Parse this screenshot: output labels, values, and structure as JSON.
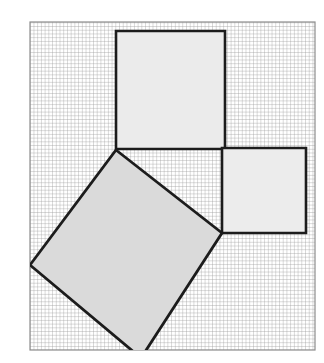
{
  "figure": {
    "kind": "geometry-diagram",
    "topic": "pythagorean-theorem-squares-on-grid",
    "title": "",
    "caption": "",
    "canvas": {
      "width": 324,
      "height": 363,
      "background": "#ffffff"
    }
  },
  "grid_paper": {
    "name": "graph-paper-frame",
    "x": 30,
    "y": 22,
    "width": 285,
    "height": 328,
    "cell_size": 3.72,
    "grid_color": "#9a9a9a",
    "grid_opacity": 0.85,
    "frame_color": "#8d8d8d",
    "frame_width": 1.2,
    "fill": "#ffffff",
    "columns": 77,
    "rows": 88
  },
  "shapes": [
    {
      "id": "square-top",
      "name": "upper-square",
      "role": "leg-square-b",
      "type": "square",
      "points": "116,31 225,31 225,149 116,149",
      "fill": "#ebebeb",
      "stroke": "#1c1c1c",
      "stroke_width": 2.6,
      "side_px": 112,
      "label": ""
    },
    {
      "id": "square-right",
      "name": "right-square",
      "role": "leg-square-a",
      "type": "square",
      "points": "222,148 306,148 306,233 222,233",
      "fill": "#ececec",
      "stroke": "#1c1c1c",
      "stroke_width": 2.6,
      "side_px": 85,
      "label": ""
    },
    {
      "id": "square-tilted",
      "name": "tilted-hypotenuse-square",
      "role": "hypotenuse-square-c",
      "type": "square",
      "points": "116,150 222,233 141,358 30,265",
      "fill": "#dadada",
      "stroke": "#1c1c1c",
      "stroke_width": 2.8,
      "side_px": 134,
      "rotation_deg": 38,
      "label": ""
    }
  ],
  "annotations": []
}
